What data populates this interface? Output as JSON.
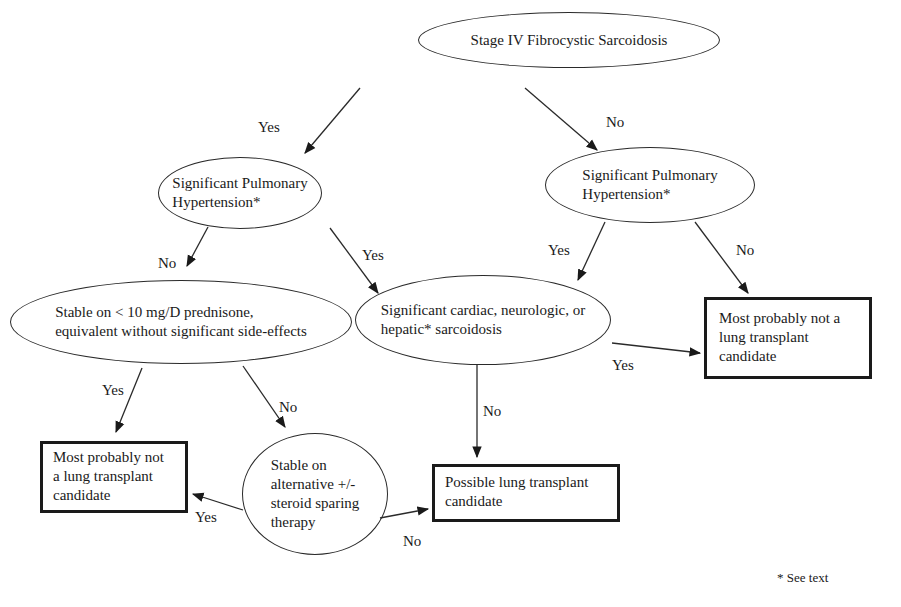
{
  "diagram": {
    "nodes": {
      "root": {
        "shape": "ellipse",
        "lines": [
          "Stage IV Fibrocystic Sarcoidosis"
        ]
      },
      "ph_left": {
        "shape": "ellipse",
        "lines": [
          "Significant Pulmonary",
          "Hypertension*"
        ]
      },
      "ph_right": {
        "shape": "ellipse",
        "lines": [
          "Significant Pulmonary",
          "Hypertension*"
        ]
      },
      "prednisone": {
        "shape": "ellipse",
        "lines": [
          "Stable on < 10 mg/D prednisone,",
          "equivalent without significant side-effects"
        ]
      },
      "cardiac": {
        "shape": "ellipse",
        "lines": [
          "Significant cardiac, neurologic, or",
          "hepatic* sarcoidosis"
        ]
      },
      "not_candidate_right": {
        "shape": "box",
        "lines": [
          "Most probably not a",
          "lung transplant",
          "candidate"
        ]
      },
      "not_candidate_left": {
        "shape": "box",
        "lines": [
          "Most probably not",
          "a lung transplant",
          "candidate"
        ]
      },
      "alternative": {
        "shape": "ellipse",
        "lines": [
          "Stable on",
          "alternative +/-",
          "steroid sparing",
          "therapy"
        ]
      },
      "possible_candidate": {
        "shape": "box",
        "lines": [
          "Possible lung transplant",
          "candidate"
        ]
      }
    },
    "edges": [
      {
        "from": "root",
        "to": "ph_left",
        "label": "Yes"
      },
      {
        "from": "root",
        "to": "ph_right",
        "label": "No"
      },
      {
        "from": "ph_left",
        "to": "prednisone",
        "label": "No"
      },
      {
        "from": "ph_left",
        "to": "cardiac",
        "label": "Yes"
      },
      {
        "from": "ph_right",
        "to": "cardiac",
        "label": "Yes"
      },
      {
        "from": "ph_right",
        "to": "not_candidate_right",
        "label": "No"
      },
      {
        "from": "cardiac",
        "to": "not_candidate_right",
        "label": "Yes"
      },
      {
        "from": "cardiac",
        "to": "possible_candidate",
        "label": "No"
      },
      {
        "from": "prednisone",
        "to": "not_candidate_left",
        "label": "Yes"
      },
      {
        "from": "prednisone",
        "to": "alternative",
        "label": "No"
      },
      {
        "from": "alternative",
        "to": "not_candidate_left",
        "label": "Yes"
      },
      {
        "from": "alternative",
        "to": "possible_candidate",
        "label": "No"
      }
    ],
    "footnote": "* See text"
  },
  "colors": {
    "stroke": "#1a1a1a",
    "background": "#ffffff",
    "text": "#1a1a1a"
  }
}
